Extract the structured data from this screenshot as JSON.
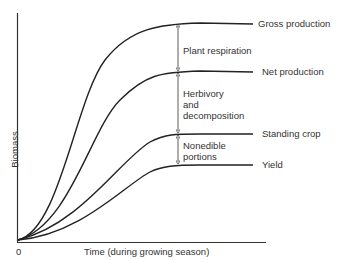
{
  "axes": {
    "ylabel": "Biomass",
    "xlabel": "Time (during growing season)",
    "origin": "0"
  },
  "curves": [
    {
      "label": "Gross production"
    },
    {
      "label": "Net production"
    },
    {
      "label": "Standing crop"
    },
    {
      "label": "Yield"
    }
  ],
  "gaps": [
    {
      "label": "Plant respiration"
    },
    {
      "label_lines": [
        "Herbivory",
        "and",
        "decomposition"
      ]
    },
    {
      "label_lines": [
        "Nonedible",
        "portions"
      ]
    }
  ]
}
